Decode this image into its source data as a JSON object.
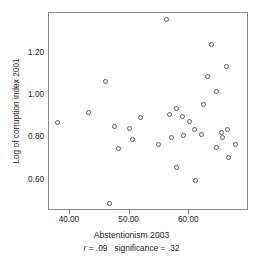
{
  "chart_data": {
    "type": "scatter",
    "title": "",
    "xlabel": "Abstentionism 2003",
    "ylabel": "Log of corruption index 2001",
    "xlim": [
      36.5,
      70.0
    ],
    "ylim": [
      0.455,
      1.39
    ],
    "xticks": [
      40.0,
      50.0,
      60.0
    ],
    "xtick_labels": [
      "40.00",
      "50.00",
      "60.00"
    ],
    "yticks": [
      0.6,
      0.8,
      1.0,
      1.2
    ],
    "ytick_labels": [
      "0.60",
      "0.80",
      "1.00",
      "1.20"
    ],
    "grid": false,
    "legend": null,
    "marker": "open-circle",
    "points": [
      {
        "x": 37.9,
        "y": 0.872
      },
      {
        "x": 43.1,
        "y": 0.921
      },
      {
        "x": 45.9,
        "y": 1.067
      },
      {
        "x": 46.6,
        "y": 0.489
      },
      {
        "x": 47.4,
        "y": 0.854
      },
      {
        "x": 48.1,
        "y": 0.748
      },
      {
        "x": 49.9,
        "y": 0.845
      },
      {
        "x": 50.5,
        "y": 0.791
      },
      {
        "x": 51.8,
        "y": 0.897
      },
      {
        "x": 54.9,
        "y": 0.768
      },
      {
        "x": 56.1,
        "y": 1.357
      },
      {
        "x": 56.6,
        "y": 0.911
      },
      {
        "x": 57.0,
        "y": 0.804
      },
      {
        "x": 57.9,
        "y": 0.939
      },
      {
        "x": 57.8,
        "y": 0.662
      },
      {
        "x": 58.8,
        "y": 0.903
      },
      {
        "x": 59.0,
        "y": 0.812
      },
      {
        "x": 60.1,
        "y": 0.88
      },
      {
        "x": 60.9,
        "y": 0.839
      },
      {
        "x": 61.0,
        "y": 0.601
      },
      {
        "x": 62.0,
        "y": 0.817
      },
      {
        "x": 62.3,
        "y": 0.958
      },
      {
        "x": 63.0,
        "y": 1.088
      },
      {
        "x": 63.8,
        "y": 1.239
      },
      {
        "x": 64.6,
        "y": 1.021
      },
      {
        "x": 64.5,
        "y": 0.753
      },
      {
        "x": 65.4,
        "y": 0.825
      },
      {
        "x": 65.5,
        "y": 0.8
      },
      {
        "x": 66.2,
        "y": 1.137
      },
      {
        "x": 66.4,
        "y": 0.841
      },
      {
        "x": 66.6,
        "y": 0.707
      },
      {
        "x": 67.7,
        "y": 0.77
      }
    ],
    "annotations": {
      "stat_r_symbol": "r",
      "stat_r_text": " = .09",
      "stat_significance_text": "significance = .32"
    }
  }
}
